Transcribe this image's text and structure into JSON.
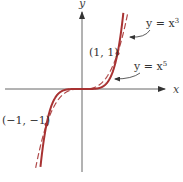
{
  "chart_data": {
    "type": "line",
    "title": "",
    "xlabel": "x",
    "ylabel": "y",
    "xlim": [
      -2.2,
      2.3
    ],
    "ylim": [
      -2.1,
      2.2
    ],
    "grid": false,
    "series": [
      {
        "name": "y = x^3",
        "label": "y = x",
        "exponent_text": "3",
        "exponent": 3,
        "style": "dashed",
        "color": "#b04a4a"
      },
      {
        "name": "y = x^5",
        "label": "y = x",
        "exponent_text": "5",
        "exponent": 5,
        "style": "solid",
        "color": "#a83232"
      }
    ],
    "points": [
      {
        "x": 1,
        "y": 1,
        "label": "(1, 1)"
      },
      {
        "x": -1,
        "y": -1,
        "label": "(−1, −1)"
      }
    ],
    "annotations": [
      {
        "text": "y = x^3",
        "points_to": "y = x^3"
      },
      {
        "text": "y = x^5",
        "points_to": "y = x^5"
      }
    ]
  },
  "axes": {
    "x_label": "x",
    "y_label": "y"
  }
}
